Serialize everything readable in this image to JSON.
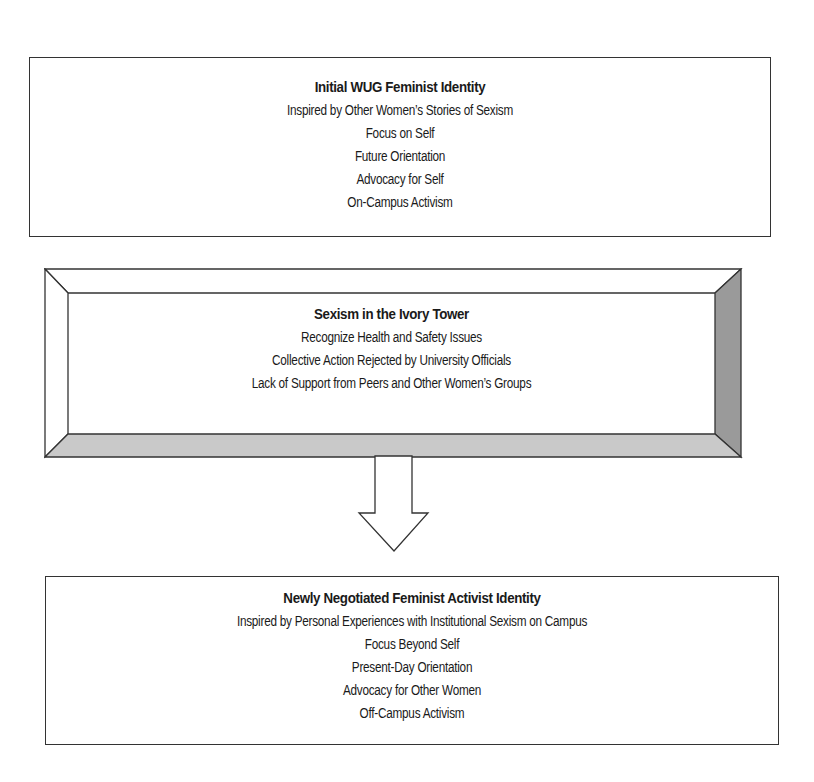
{
  "diagram": {
    "initial": {
      "title": "Initial WUG Feminist Identity",
      "lines": [
        "Inspired by Other Women’s Stories of Sexism",
        "Focus on Self",
        "Future Orientation",
        "Advocacy for Self",
        "On-Campus Activism"
      ]
    },
    "catalyst": {
      "title": "Sexism in the Ivory Tower",
      "lines": [
        "Recognize Health and Safety Issues",
        "Collective Action Rejected by University Officials",
        "Lack of Support from Peers and Other Women’s Groups"
      ]
    },
    "result": {
      "title": "Newly Negotiated Feminist Activist Identity",
      "lines": [
        "Inspired by Personal Experiences with Institutional Sexism on Campus",
        "Focus Beyond Self",
        "Present-Day Orientation",
        "Advocacy for Other Women",
        "Off-Campus Activism"
      ]
    },
    "colors": {
      "border": "#333333",
      "bevel_right": "#9a9a9a",
      "bevel_bottom": "#c9c9c9",
      "fill": "#ffffff"
    }
  }
}
